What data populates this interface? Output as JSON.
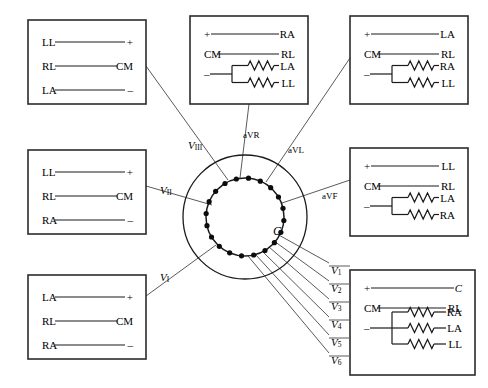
{
  "diagram": {
    "center_label": "C",
    "line_color": "#1a1a1a",
    "box_border_color": "#2b2b2b",
    "background": "#ffffff"
  },
  "boxes": [
    {
      "id": "box-lead-III",
      "name": "lead-iii-box",
      "x": 28,
      "y": 20,
      "w": 118,
      "h": 84,
      "rows": [
        {
          "left": "LL",
          "right": "+",
          "type": "plain"
        },
        {
          "left": "RL",
          "right": "CM",
          "type": "plain"
        },
        {
          "left": "LA",
          "right": "–",
          "type": "plain"
        }
      ]
    },
    {
      "id": "box-lead-aVR",
      "name": "lead-avr-box",
      "x": 190,
      "y": 16,
      "w": 118,
      "h": 88,
      "rows": [
        {
          "left": "+",
          "right": "RA",
          "type": "plain"
        },
        {
          "left": "CM",
          "right": "RL",
          "type": "plain"
        },
        {
          "left": "–",
          "right": [
            "LA",
            "LL"
          ],
          "type": "resistor2"
        }
      ]
    },
    {
      "id": "box-lead-aVL",
      "name": "lead-avl-box",
      "x": 350,
      "y": 16,
      "w": 118,
      "h": 88,
      "rows": [
        {
          "left": "+",
          "right": "LA",
          "type": "plain"
        },
        {
          "left": "CM",
          "right": "RL",
          "type": "plain"
        },
        {
          "left": "–",
          "right": [
            "RA",
            "LL"
          ],
          "type": "resistor2"
        }
      ]
    },
    {
      "id": "box-lead-II",
      "name": "lead-ii-box",
      "x": 28,
      "y": 150,
      "w": 118,
      "h": 84,
      "rows": [
        {
          "left": "LL",
          "right": "+",
          "type": "plain"
        },
        {
          "left": "RL",
          "right": "CM",
          "type": "plain"
        },
        {
          "left": "RA",
          "right": "–",
          "type": "plain"
        }
      ]
    },
    {
      "id": "box-lead-aVF",
      "name": "lead-avf-box",
      "x": 350,
      "y": 148,
      "w": 118,
      "h": 88,
      "rows": [
        {
          "left": "+",
          "right": "LL",
          "type": "plain"
        },
        {
          "left": "CM",
          "right": "RL",
          "type": "plain"
        },
        {
          "left": "–",
          "right": [
            "LA",
            "RA"
          ],
          "type": "resistor2"
        }
      ]
    },
    {
      "id": "box-lead-I",
      "name": "lead-i-box",
      "x": 28,
      "y": 275,
      "w": 118,
      "h": 84,
      "rows": [
        {
          "left": "LA",
          "right": "+",
          "type": "plain"
        },
        {
          "left": "RL",
          "right": "CM",
          "type": "plain"
        },
        {
          "left": "RA",
          "right": "–",
          "type": "plain"
        }
      ]
    },
    {
      "id": "box-lead-V",
      "name": "lead-v-precordial-box",
      "x": 350,
      "y": 270,
      "w": 125,
      "h": 105,
      "rows": [
        {
          "left": "+",
          "right": "C",
          "type": "plain-italic-right"
        },
        {
          "left": "CM",
          "right": "RL",
          "type": "plain"
        },
        {
          "left": "–",
          "right": [
            "RA",
            "LA",
            "LL"
          ],
          "type": "resistor3"
        }
      ]
    }
  ],
  "lead_labels": [
    {
      "name": "lead-label-v3",
      "text": "V",
      "sub": "III",
      "x": 188,
      "y": 139
    },
    {
      "name": "lead-label-avr",
      "text": "aVR",
      "sub": "",
      "x": 243,
      "y": 130
    },
    {
      "name": "lead-label-avl",
      "text": "aVL",
      "sub": "",
      "x": 288,
      "y": 145
    },
    {
      "name": "lead-label-v2",
      "text": "V",
      "sub": "II",
      "x": 160,
      "y": 184
    },
    {
      "name": "lead-label-avf",
      "text": "aVF",
      "sub": "",
      "x": 322,
      "y": 191
    },
    {
      "name": "lead-label-v1",
      "text": "V",
      "sub": "I",
      "x": 160,
      "y": 271
    }
  ],
  "v_leads": [
    {
      "name": "lead-label-v1-precordial",
      "text": "V",
      "sub": "1",
      "x": 331,
      "y": 264
    },
    {
      "name": "lead-label-v2-precordial",
      "text": "V",
      "sub": "2",
      "x": 331,
      "y": 282
    },
    {
      "name": "lead-label-v3-precordial",
      "text": "V",
      "sub": "3",
      "x": 331,
      "y": 300
    },
    {
      "name": "lead-label-v4-precordial",
      "text": "V",
      "sub": "4",
      "x": 331,
      "y": 318
    },
    {
      "name": "lead-label-v5-precordial",
      "text": "V",
      "sub": "5",
      "x": 331,
      "y": 336
    },
    {
      "name": "lead-label-v6-precordial",
      "text": "V",
      "sub": "6",
      "x": 331,
      "y": 354
    }
  ],
  "switch": {
    "name": "rotary-lead-selector",
    "cx": 245,
    "cy": 217,
    "outer_radius": 62,
    "inner_radius": 39,
    "contact_count": 20,
    "contact_radius": 2.6
  },
  "connector_lines": [
    {
      "name": "connector-lead-iii",
      "x1": 146,
      "y1": 66,
      "x2": 228,
      "y2": 180
    },
    {
      "name": "connector-avr",
      "x1": 249,
      "y1": 104,
      "x2": 240,
      "y2": 178
    },
    {
      "name": "connector-avl",
      "x1": 350,
      "y1": 58,
      "x2": 266,
      "y2": 182
    },
    {
      "name": "connector-lead-ii",
      "x1": 146,
      "y1": 186,
      "x2": 212,
      "y2": 205
    },
    {
      "name": "connector-avf",
      "x1": 350,
      "y1": 180,
      "x2": 282,
      "y2": 203
    },
    {
      "name": "connector-lead-i",
      "x1": 146,
      "y1": 296,
      "x2": 216,
      "y2": 245
    },
    {
      "name": "connector-v1",
      "x1": 329,
      "y1": 263,
      "x2": 277,
      "y2": 234
    },
    {
      "name": "connector-v2",
      "x1": 329,
      "y1": 281,
      "x2": 274,
      "y2": 241
    },
    {
      "name": "connector-v3",
      "x1": 329,
      "y1": 299,
      "x2": 269,
      "y2": 247
    },
    {
      "name": "connector-v4",
      "x1": 329,
      "y1": 317,
      "x2": 263,
      "y2": 252
    },
    {
      "name": "connector-v5",
      "x1": 329,
      "y1": 335,
      "x2": 256,
      "y2": 255
    },
    {
      "name": "connector-v6",
      "x1": 329,
      "y1": 353,
      "x2": 248,
      "y2": 256
    }
  ]
}
